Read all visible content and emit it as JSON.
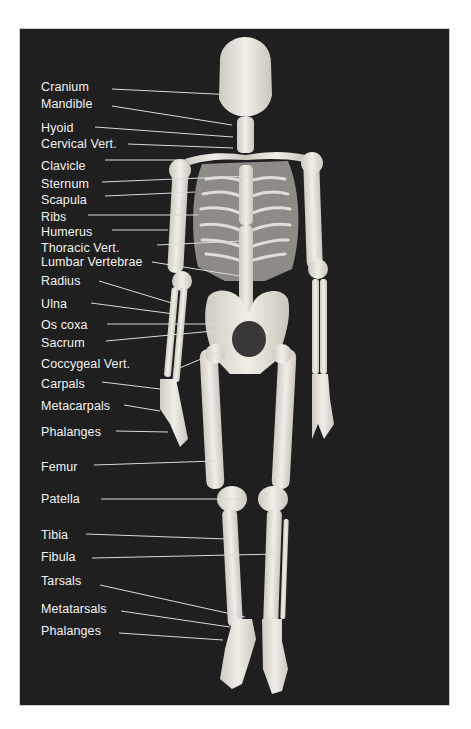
{
  "figure": {
    "background_color": "#1f1f1f",
    "label_color": "#f2f2f2",
    "line_color": "#d9d9d9",
    "bone_color": "#e6e3dc"
  },
  "labels": [
    {
      "text": "Cranium",
      "x": 21,
      "y": 51,
      "line": [
        92,
        60,
        215,
        66
      ]
    },
    {
      "text": "Mandible",
      "x": 21,
      "y": 68,
      "line": [
        92,
        77,
        212,
        96
      ]
    },
    {
      "text": "Hyoid",
      "x": 21,
      "y": 92,
      "line": [
        75,
        98,
        213,
        108
      ]
    },
    {
      "text": "Cervical Vert.",
      "x": 21,
      "y": 108,
      "line": [
        108,
        115,
        213,
        119
      ]
    },
    {
      "text": "Clavicle",
      "x": 21,
      "y": 130,
      "line": [
        85,
        131,
        183,
        131
      ]
    },
    {
      "text": "Sternum",
      "x": 21,
      "y": 148,
      "line": [
        82,
        153,
        230,
        147
      ]
    },
    {
      "text": "Scapula",
      "x": 21,
      "y": 164,
      "line": [
        85,
        167,
        175,
        163
      ]
    },
    {
      "text": "Ribs",
      "x": 21,
      "y": 181,
      "line": [
        68,
        186,
        178,
        186
      ]
    },
    {
      "text": "Humerus",
      "x": 21,
      "y": 196,
      "line": [
        92,
        201,
        148,
        201
      ]
    },
    {
      "text": "Thoracic Vert.",
      "x": 21,
      "y": 212,
      "line": [
        137,
        216,
        222,
        212
      ]
    },
    {
      "text": "Lumbar Vertebrae",
      "x": 21,
      "y": 226,
      "line": [
        132,
        233,
        220,
        247
      ]
    },
    {
      "text": "Radius",
      "x": 21,
      "y": 245,
      "line": [
        79,
        252,
        155,
        275
      ]
    },
    {
      "text": "Ulna",
      "x": 21,
      "y": 268,
      "line": [
        71,
        274,
        154,
        285
      ]
    },
    {
      "text": "Os coxa",
      "x": 21,
      "y": 289,
      "line": [
        87,
        295,
        210,
        295
      ]
    },
    {
      "text": "Sacrum",
      "x": 21,
      "y": 307,
      "line": [
        86,
        312,
        215,
        300
      ]
    },
    {
      "text": "Coccygeal Vert.",
      "x": 21,
      "y": 328,
      "line": [
        157,
        340,
        210,
        318
      ]
    },
    {
      "text": "Carpals",
      "x": 21,
      "y": 348,
      "line": [
        82,
        353,
        140,
        360
      ]
    },
    {
      "text": "Metacarpals",
      "x": 21,
      "y": 370,
      "line": [
        104,
        376,
        140,
        382
      ]
    },
    {
      "text": "Phalanges",
      "x": 21,
      "y": 396,
      "line": [
        96,
        402,
        148,
        403
      ]
    },
    {
      "text": "Femur",
      "x": 21,
      "y": 431,
      "line": [
        74,
        436,
        195,
        432
      ]
    },
    {
      "text": "Patella",
      "x": 21,
      "y": 463,
      "line": [
        81,
        470,
        223,
        470
      ]
    },
    {
      "text": "Tibia",
      "x": 21,
      "y": 499,
      "line": [
        66,
        505,
        207,
        510
      ]
    },
    {
      "text": "Fibula",
      "x": 21,
      "y": 521,
      "line": [
        72,
        529,
        258,
        525
      ]
    },
    {
      "text": "Tarsals",
      "x": 21,
      "y": 545,
      "line": [
        80,
        556,
        225,
        588
      ]
    },
    {
      "text": "Metatarsals",
      "x": 21,
      "y": 573,
      "line": [
        101,
        582,
        210,
        598
      ]
    },
    {
      "text": "Phalanges",
      "x": 21,
      "y": 595,
      "line": [
        99,
        604,
        203,
        611
      ]
    }
  ]
}
